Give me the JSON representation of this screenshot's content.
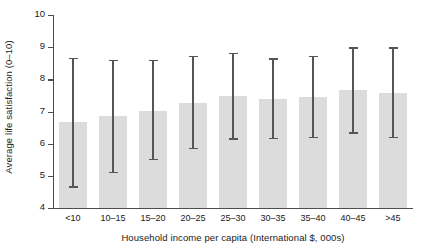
{
  "chart_data": {
    "type": "bar",
    "title": "",
    "xlabel": "Household income per capita (International $, 000s)",
    "ylabel": "Average life satisfaction (0–10)",
    "categories": [
      "<10",
      "10–15",
      "15–20",
      "20–25",
      "25–30",
      "30–35",
      "35–40",
      "40–45",
      ">45"
    ],
    "values": [
      6.67,
      6.85,
      7.03,
      7.28,
      7.47,
      7.4,
      7.46,
      7.67,
      7.58
    ],
    "error_upper": [
      8.66,
      8.6,
      8.61,
      8.73,
      8.82,
      8.65,
      8.73,
      9.0,
      8.99
    ],
    "error_lower": [
      4.68,
      5.13,
      5.52,
      5.88,
      6.17,
      6.19,
      6.21,
      6.35,
      6.22
    ],
    "ylim": [
      4,
      10
    ],
    "yticks": [
      4,
      5,
      6,
      7,
      8,
      9,
      10
    ],
    "ytick_labels": [
      "4",
      "5",
      "6",
      "7",
      "8",
      "9",
      "10"
    ],
    "grid": false,
    "legend": "none",
    "bar_color": "#dcdcdc",
    "error_color": "#555555",
    "axis_color": "#4d4d4d",
    "text_color": "#1a1a1a"
  }
}
